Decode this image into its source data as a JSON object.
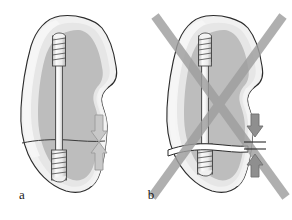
{
  "figure": {
    "width": 292,
    "height": 220,
    "background": "#ffffff"
  },
  "panels": [
    {
      "id": "a",
      "label": "a",
      "label_x": 22,
      "label_y": 199,
      "meaning": "correct-compression",
      "marked_incorrect": false,
      "fracture_gap": false,
      "arrows": {
        "style": "tip-to-tip",
        "down_arrow_name": "compression-arrow-down",
        "up_arrow_name": "compression-arrow-up",
        "color": "#c8c8c8",
        "outline": "#9a9a9a"
      }
    },
    {
      "id": "b",
      "label": "b",
      "label_x": 151,
      "label_y": 199,
      "meaning": "incorrect-gap",
      "marked_incorrect": true,
      "fracture_gap": true,
      "arrows": {
        "style": "separated-by-gap-line",
        "down_arrow_name": "distraction-arrow-down",
        "up_arrow_name": "distraction-arrow-up",
        "color": "#8f8f8f",
        "outline": "#6f6f6f"
      },
      "cross_mark": {
        "name": "invalid-cross-mark",
        "color": "#9e9e9e",
        "stroke_width": 9
      }
    }
  ],
  "colors": {
    "bone_outline": "#2b2b2b",
    "bone_cortical_fill": "#f0f0f0",
    "bone_inner_fill": "#e2e2e2",
    "bone_cancellous_fill": "#bcbcbc",
    "screw_fill": "#fafafa",
    "screw_outline": "#4a4a4a",
    "screw_shade": "#d6d6d6",
    "cross_gray": "#9e9e9e",
    "arrow_light": "#c8c8c8",
    "arrow_dark": "#8f8f8f",
    "label_text": "#1a1a1a"
  },
  "elements": {
    "bone_outline_name": "bone-outline",
    "cancellous_name": "cancellous-bone-region",
    "screw_name": "cannulated-bone-screw",
    "screw_head_threads_name": "screw-proximal-threads",
    "screw_tip_threads_name": "screw-distal-threads",
    "fracture_line_name": "fracture-line",
    "fracture_gap_name": "fracture-gap"
  }
}
